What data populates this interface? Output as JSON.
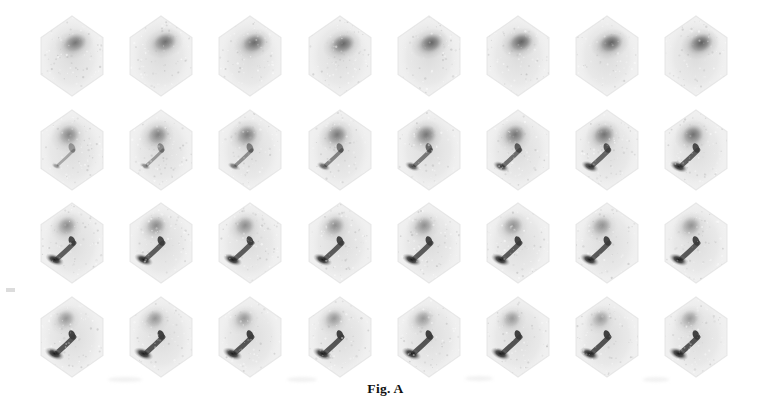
{
  "figure": {
    "caption": "Fig. A",
    "modality": "hepatobiliary-scintigraphy",
    "grid": {
      "rows": 4,
      "columns": 8,
      "total_frames": 32
    },
    "colors": {
      "page_background": "#ffffff",
      "frame_background": "#f0f0f0",
      "frame_edge": "#e2e2e2",
      "uptake_mid": "#8d8d8d",
      "uptake_dark": "#4a4a4a",
      "uptake_hot": "#151515",
      "caption_text": "#111111",
      "artifact": "#f1f1f1"
    },
    "layout": {
      "grid_left": 42,
      "grid_top": 18,
      "column_pitch": 89.2,
      "row_pitch": 93.5,
      "frame_width": 76,
      "frame_height": 92,
      "caption_top": 381
    }
  },
  "rows": [
    {
      "index": 1,
      "label": "row-1-early-hepatic-phase",
      "hot_focus": false,
      "duct_streak": 0.0,
      "blob": {
        "cx": 40,
        "cy": 34,
        "rx": 20,
        "ry": 15,
        "rot": -18,
        "dark": 0.78
      },
      "frames": [
        {
          "column": 1,
          "intensity": 0.74,
          "blob_dx": 0,
          "blob_dy": 0
        },
        {
          "column": 2,
          "intensity": 0.8,
          "blob_dx": 1,
          "blob_dy": -1
        },
        {
          "column": 3,
          "intensity": 0.84,
          "blob_dx": 1,
          "blob_dy": 0
        },
        {
          "column": 4,
          "intensity": 0.88,
          "blob_dx": 0,
          "blob_dy": 1
        },
        {
          "column": 5,
          "intensity": 0.9,
          "blob_dx": -1,
          "blob_dy": 0
        },
        {
          "column": 6,
          "intensity": 0.92,
          "blob_dx": 0,
          "blob_dy": -1
        },
        {
          "column": 7,
          "intensity": 0.93,
          "blob_dx": 1,
          "blob_dy": 0
        },
        {
          "column": 8,
          "intensity": 0.95,
          "blob_dx": 2,
          "blob_dy": 0
        }
      ]
    },
    {
      "index": 2,
      "label": "row-2-biliary-excretion-phase",
      "hot_focus": true,
      "duct_streak": 0.55,
      "blob": {
        "cx": 34,
        "cy": 32,
        "rx": 18,
        "ry": 16,
        "rot": -25,
        "dark": 0.7
      },
      "frames": [
        {
          "column": 1,
          "intensity": 0.62,
          "focus": 0.1,
          "streak": 0.18
        },
        {
          "column": 2,
          "intensity": 0.66,
          "focus": 0.22,
          "streak": 0.3
        },
        {
          "column": 3,
          "intensity": 0.7,
          "focus": 0.34,
          "streak": 0.42
        },
        {
          "column": 4,
          "intensity": 0.72,
          "focus": 0.46,
          "streak": 0.52
        },
        {
          "column": 5,
          "intensity": 0.74,
          "focus": 0.58,
          "streak": 0.62
        },
        {
          "column": 6,
          "intensity": 0.76,
          "focus": 0.7,
          "streak": 0.72
        },
        {
          "column": 7,
          "intensity": 0.78,
          "focus": 0.8,
          "streak": 0.8
        },
        {
          "column": 8,
          "intensity": 0.8,
          "focus": 0.88,
          "streak": 0.86
        }
      ]
    },
    {
      "index": 3,
      "label": "row-3-gallbladder-filling-phase",
      "hot_focus": true,
      "duct_streak": 0.9,
      "blob": {
        "cx": 32,
        "cy": 30,
        "rx": 17,
        "ry": 15,
        "rot": -28,
        "dark": 0.62
      },
      "frames": [
        {
          "column": 1,
          "intensity": 0.58,
          "focus": 0.92,
          "streak": 0.88
        },
        {
          "column": 2,
          "intensity": 0.58,
          "focus": 0.93,
          "streak": 0.88
        },
        {
          "column": 3,
          "intensity": 0.57,
          "focus": 0.94,
          "streak": 0.89
        },
        {
          "column": 4,
          "intensity": 0.56,
          "focus": 0.95,
          "streak": 0.9
        },
        {
          "column": 5,
          "intensity": 0.55,
          "focus": 0.95,
          "streak": 0.9
        },
        {
          "column": 6,
          "intensity": 0.54,
          "focus": 0.96,
          "streak": 0.91
        },
        {
          "column": 7,
          "intensity": 0.53,
          "focus": 0.96,
          "streak": 0.91
        },
        {
          "column": 8,
          "intensity": 0.52,
          "focus": 0.97,
          "streak": 0.92
        }
      ]
    },
    {
      "index": 4,
      "label": "row-4-late-bowel-transit-phase",
      "hot_focus": true,
      "duct_streak": 1.0,
      "blob": {
        "cx": 31,
        "cy": 29,
        "rx": 16,
        "ry": 14,
        "rot": -30,
        "dark": 0.55
      },
      "frames": [
        {
          "column": 1,
          "intensity": 0.5,
          "focus": 1.0,
          "streak": 0.95
        },
        {
          "column": 2,
          "intensity": 0.5,
          "focus": 1.0,
          "streak": 0.95
        },
        {
          "column": 3,
          "intensity": 0.49,
          "focus": 1.0,
          "streak": 0.96
        },
        {
          "column": 4,
          "intensity": 0.49,
          "focus": 1.0,
          "streak": 0.96
        },
        {
          "column": 5,
          "intensity": 0.48,
          "focus": 1.0,
          "streak": 0.96
        },
        {
          "column": 6,
          "intensity": 0.48,
          "focus": 1.0,
          "streak": 0.97
        },
        {
          "column": 7,
          "intensity": 0.47,
          "focus": 1.0,
          "streak": 0.97
        },
        {
          "column": 8,
          "intensity": 0.47,
          "focus": 1.0,
          "streak": 0.97
        }
      ]
    }
  ],
  "artifacts": [
    {
      "name": "artifact-under-frame-r4c1",
      "x": 108,
      "y": 377,
      "w": 34,
      "h": 5
    },
    {
      "name": "artifact-under-frame-r4c3",
      "x": 287,
      "y": 377,
      "w": 30,
      "h": 5
    },
    {
      "name": "artifact-under-frame-r4c5",
      "x": 465,
      "y": 376,
      "w": 28,
      "h": 5
    },
    {
      "name": "artifact-under-frame-r4c7",
      "x": 643,
      "y": 377,
      "w": 26,
      "h": 5
    },
    {
      "name": "artifact-left-margin-mark",
      "x": 6,
      "y": 288,
      "w": 9,
      "h": 4
    }
  ]
}
